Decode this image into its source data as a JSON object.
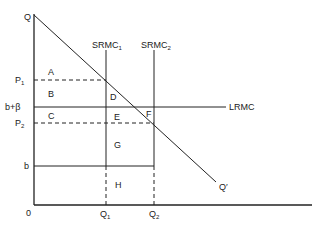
{
  "diagram": {
    "axes": {
      "origin": "0",
      "y_top_label": "Q",
      "x_end_label": "Q′"
    },
    "y_labels": {
      "p1": "P",
      "p1_sub": "1",
      "b_beta": "b+β",
      "p2": "P",
      "p2_sub": "2",
      "b": "b"
    },
    "x_labels": {
      "q1": "Q",
      "q1_sub": "1",
      "q2": "Q",
      "q2_sub": "2"
    },
    "curves": {
      "srmc1": "SRMC",
      "srmc1_sub": "1",
      "srmc2": "SRMC",
      "srmc2_sub": "2",
      "lrmc": "LRMC"
    },
    "regions": {
      "a": "A",
      "b": "B",
      "c": "C",
      "d": "D",
      "e": "E",
      "f": "F",
      "g": "G",
      "h": "H"
    }
  }
}
